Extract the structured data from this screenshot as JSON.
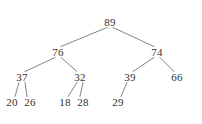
{
  "figure": {
    "kind": "binary-tree-diagram",
    "width": 202,
    "height": 124,
    "background_color": "#ffffff",
    "edge_color": "#767676",
    "node_text_color": "#303030"
  },
  "chart_data": {
    "type": "diagram",
    "title": "",
    "nodes": [
      {
        "id": "n89",
        "label": "89",
        "x": 110,
        "y": 22,
        "level": 0
      },
      {
        "id": "n76",
        "label": "76",
        "x": 58,
        "y": 52,
        "level": 1
      },
      {
        "id": "n74",
        "label": "74",
        "x": 157,
        "y": 52,
        "level": 1
      },
      {
        "id": "n37",
        "label": "37",
        "x": 22,
        "y": 77,
        "level": 2
      },
      {
        "id": "n32",
        "label": "32",
        "x": 80,
        "y": 77,
        "level": 2
      },
      {
        "id": "n39",
        "label": "39",
        "x": 130,
        "y": 77,
        "level": 2
      },
      {
        "id": "n66",
        "label": "66",
        "x": 177,
        "y": 77,
        "level": 2
      },
      {
        "id": "n20",
        "label": "20",
        "x": 12,
        "y": 102,
        "level": 3
      },
      {
        "id": "n26",
        "label": "26",
        "x": 30,
        "y": 102,
        "level": 3
      },
      {
        "id": "n18",
        "label": "18",
        "x": 65,
        "y": 102,
        "level": 3
      },
      {
        "id": "n28",
        "label": "28",
        "x": 83,
        "y": 102,
        "level": 3
      },
      {
        "id": "n29",
        "label": "29",
        "x": 118,
        "y": 102,
        "level": 3
      }
    ],
    "edges": [
      {
        "from": "n89",
        "to": "n76",
        "side": "left"
      },
      {
        "from": "n89",
        "to": "n74",
        "side": "right"
      },
      {
        "from": "n76",
        "to": "n37",
        "side": "left"
      },
      {
        "from": "n76",
        "to": "n32",
        "side": "right"
      },
      {
        "from": "n74",
        "to": "n39",
        "side": "left"
      },
      {
        "from": "n74",
        "to": "n66",
        "side": "right"
      },
      {
        "from": "n37",
        "to": "n20",
        "side": "left"
      },
      {
        "from": "n37",
        "to": "n26",
        "side": "right"
      },
      {
        "from": "n32",
        "to": "n18",
        "side": "left"
      },
      {
        "from": "n32",
        "to": "n28",
        "side": "right"
      },
      {
        "from": "n39",
        "to": "n29",
        "side": "left"
      }
    ]
  }
}
